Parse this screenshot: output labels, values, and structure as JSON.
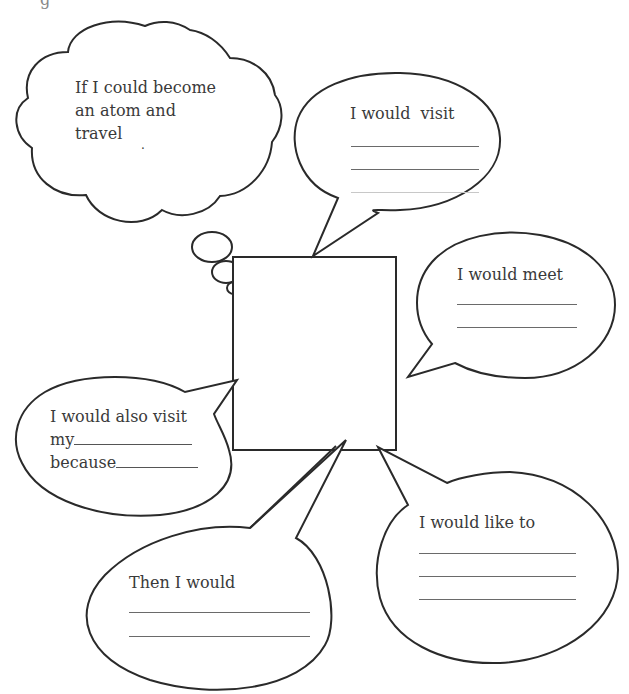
{
  "worksheet": {
    "title_fragment": "g",
    "center_box": {
      "label": ""
    },
    "thought_cloud": {
      "lines": [
        "If I could become",
        "an atom and",
        "travel"
      ],
      "dot": "."
    },
    "bubbles": {
      "visit": {
        "prompt": "I would  visit",
        "blank_lines": 3
      },
      "meet": {
        "prompt": "I would meet",
        "blank_lines": 2
      },
      "also_visit": {
        "line1": "I would also visit",
        "line2_prefix": "my",
        "line3_prefix": "because"
      },
      "then": {
        "prompt": "Then I would",
        "blank_lines": 2
      },
      "like": {
        "prompt": "I would like to",
        "blank_lines": 3
      }
    },
    "colors": {
      "stroke": "#2a2a2a",
      "text": "#3a3a3a",
      "background": "#ffffff"
    }
  }
}
